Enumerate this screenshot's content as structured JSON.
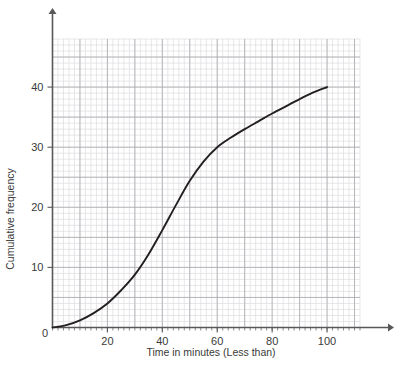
{
  "chart_data": {
    "type": "line",
    "title": "",
    "xlabel": "Time in minutes (Less than)",
    "ylabel": "Cumulative frequency",
    "xlim": [
      0,
      112
    ],
    "ylim": [
      0,
      48
    ],
    "grid": true,
    "legend": "none",
    "x_ticks": [
      {
        "value": 20,
        "label": "20"
      },
      {
        "value": 40,
        "label": "40"
      },
      {
        "value": 60,
        "label": "60"
      },
      {
        "value": 80,
        "label": "80"
      },
      {
        "value": 100,
        "label": "100"
      }
    ],
    "y_ticks": [
      {
        "value": 0,
        "label": "0"
      },
      {
        "value": 10,
        "label": "10"
      },
      {
        "value": 20,
        "label": "20"
      },
      {
        "value": 30,
        "label": "30"
      },
      {
        "value": 40,
        "label": "40"
      }
    ],
    "origin_label": "0",
    "series": [
      {
        "name": "Cumulative frequency curve",
        "color": "#231f20",
        "x": [
          0,
          5,
          10,
          15,
          20,
          25,
          30,
          35,
          40,
          45,
          50,
          55,
          60,
          65,
          70,
          75,
          80,
          85,
          90,
          95,
          100
        ],
        "values": [
          0,
          0.4,
          1.2,
          2.4,
          4.0,
          6.2,
          8.8,
          12.2,
          16.2,
          20.4,
          24.4,
          27.6,
          30.0,
          31.6,
          33.0,
          34.3,
          35.6,
          36.8,
          38.0,
          39.1,
          40.0
        ]
      }
    ],
    "grid_minor_x_step": 2,
    "grid_minor_y_step": 1,
    "grid_major_x_step": 10,
    "grid_major_y_step": 5,
    "colors": {
      "curve": "#231f20",
      "axis": "#58585a",
      "grid_major": "#a9a9ae",
      "grid_minor": "#dcdce0",
      "text": "#3a3a3a",
      "background": "#ffffff"
    }
  }
}
